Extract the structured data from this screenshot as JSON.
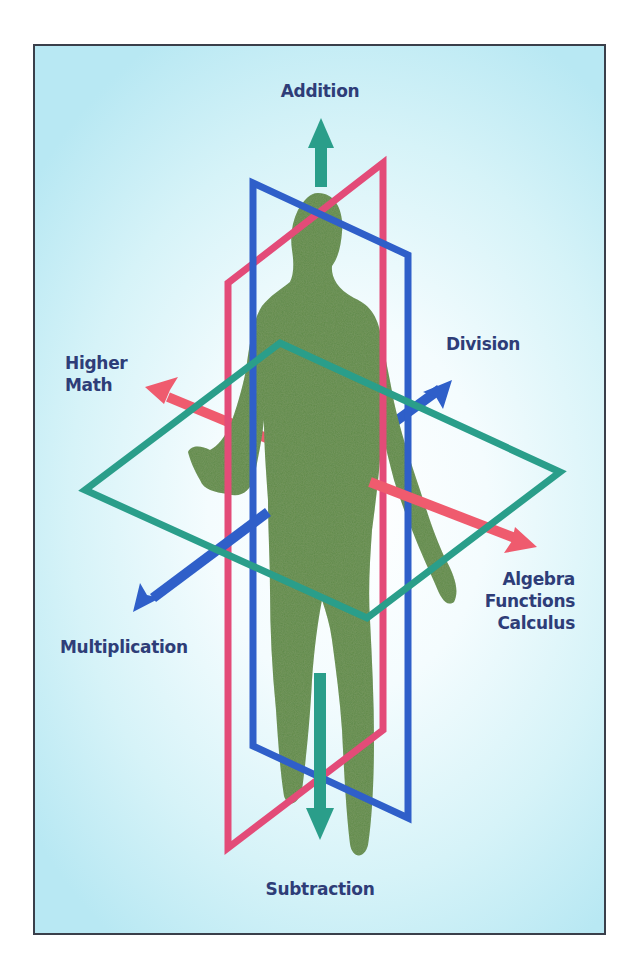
{
  "diagram": {
    "labels": {
      "up": "Addition",
      "down": "Subtraction",
      "upper_left": [
        "Higher",
        "Math"
      ],
      "upper_right": "Division",
      "lower_left": "Multiplication",
      "lower_right": [
        "Algebra",
        "Functions",
        "Calculus"
      ]
    },
    "planes": [
      {
        "name": "sagittal-plane",
        "color": "#2f5fc9"
      },
      {
        "name": "coronal-plane",
        "color": "#e34b78"
      },
      {
        "name": "transverse-plane",
        "color": "#2a9e8a"
      }
    ],
    "axes": [
      {
        "name": "vertical-axis",
        "color": "#2a9e8a",
        "positive": "Addition",
        "negative": "Subtraction"
      },
      {
        "name": "left-right-axis",
        "color": "#ef5b6e",
        "positive": "Algebra Functions Calculus",
        "negative": "Higher Math"
      },
      {
        "name": "front-back-axis",
        "color": "#2f5fc9",
        "positive": "Division",
        "negative": "Multiplication"
      }
    ],
    "figure": {
      "color": "#5e8a4a",
      "description": "human silhouette"
    }
  }
}
